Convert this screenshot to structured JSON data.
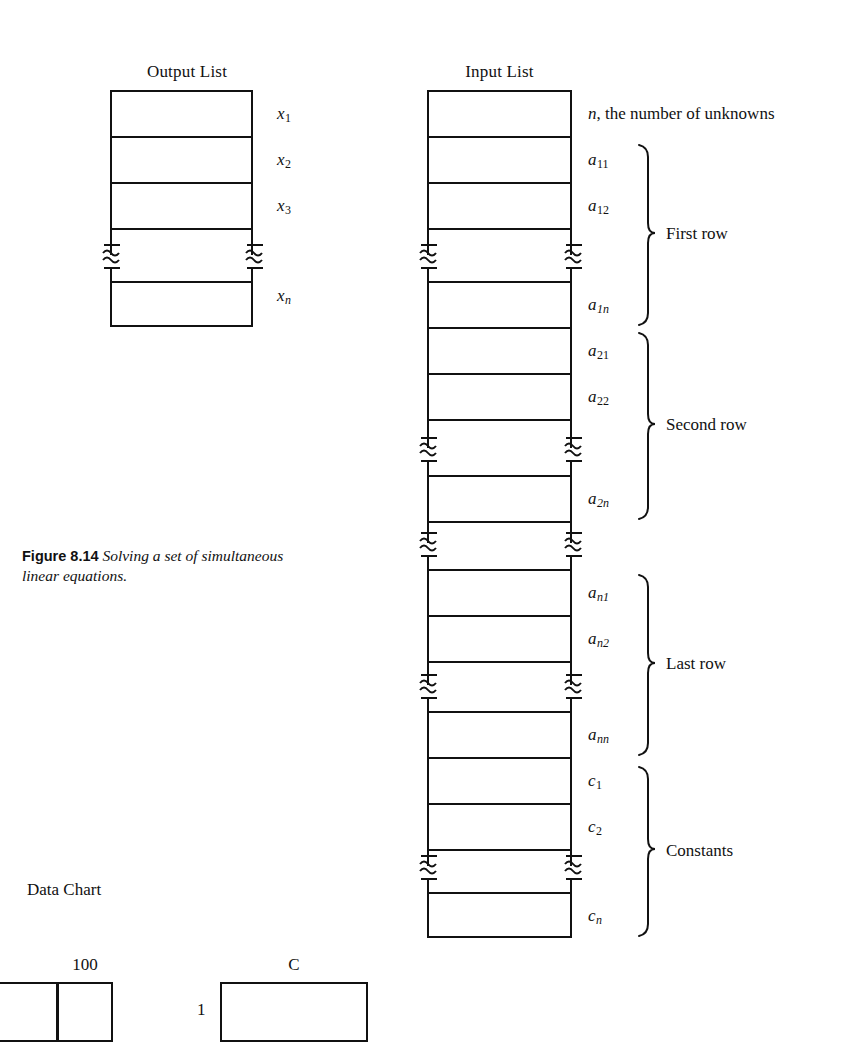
{
  "figure": {
    "caption_label": "Figure 8.14",
    "caption_text": "Solving a set of simultaneous linear equations."
  },
  "output_list": {
    "header": "Output List",
    "cells": [
      {
        "label": "x",
        "sub": "1"
      },
      {
        "label": "x",
        "sub": "2"
      },
      {
        "label": "x",
        "sub": "3"
      },
      {
        "label": "x",
        "sub": "n",
        "sub_italic": true
      }
    ]
  },
  "input_list": {
    "header": "Input List",
    "top_label": "n, the number of unknowns",
    "top_label_italic_part": "n",
    "top_label_rest": ", the number of unknowns",
    "cells": [
      {
        "label": "a",
        "sub": "11"
      },
      {
        "label": "a",
        "sub": "12"
      },
      {
        "label": "a",
        "sub": "1n",
        "sub_italic": true
      },
      {
        "label": "a",
        "sub": "21"
      },
      {
        "label": "a",
        "sub": "22"
      },
      {
        "label": "a",
        "sub": "2n",
        "sub_italic": true
      },
      {
        "label": "a",
        "sub": "n1",
        "sub_italic": true
      },
      {
        "label": "a",
        "sub": "n2",
        "sub_italic": true
      },
      {
        "label": "a",
        "sub": "nn",
        "sub_italic": true
      },
      {
        "label": "c",
        "sub": "1"
      },
      {
        "label": "c",
        "sub": "2"
      },
      {
        "label": "c",
        "sub": "n",
        "sub_italic": true
      }
    ],
    "groups": [
      {
        "name": "First row"
      },
      {
        "name": "Second row"
      },
      {
        "name": "Last row"
      },
      {
        "name": "Constants"
      }
    ]
  },
  "data_chart": {
    "title": "Data Chart",
    "label_100": "100",
    "label_C": "C",
    "label_1": "1"
  },
  "colors": {
    "ink": "#111111",
    "page": "#ffffff"
  }
}
